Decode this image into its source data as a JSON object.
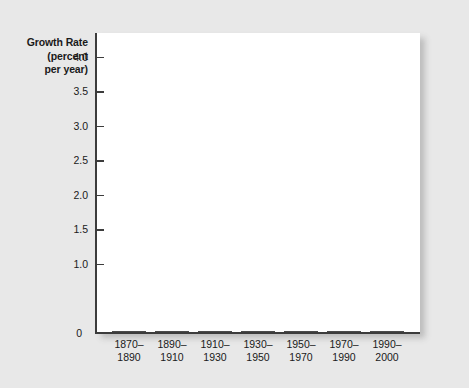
{
  "chart_data": {
    "type": "bar",
    "title": "",
    "subtitle": "",
    "xlabel": "",
    "ylabel": "Growth Rate (percent per year)",
    "ylabel_lines": [
      "Growth Rate",
      "(percent",
      "per year)"
    ],
    "categories": [
      "1870–1890",
      "1890–1910",
      "1910–1930",
      "1930–1950",
      "1950–1970",
      "1970–1990",
      "1990–2000"
    ],
    "category_lines": [
      [
        "1870–",
        "1890"
      ],
      [
        "1890–",
        "1910"
      ],
      [
        "1910–",
        "1930"
      ],
      [
        "1930–",
        "1950"
      ],
      [
        "1950–",
        "1970"
      ],
      [
        "1970–",
        "1990"
      ],
      [
        "1990–",
        "2000"
      ]
    ],
    "values": [
      1.18,
      1.5,
      1.31,
      1.41,
      3.87,
      2.19,
      1.73
    ],
    "ylim": [
      0,
      4.35
    ],
    "yticks": [
      0,
      1.0,
      1.5,
      2.0,
      2.5,
      3.0,
      3.5,
      4.0
    ],
    "ytick_labels": [
      "0",
      "1.0",
      "1.5",
      "2.0",
      "2.5",
      "3.0",
      "3.5",
      "4.0"
    ],
    "grid": false,
    "legend": null,
    "legend_position": "none",
    "bar_color": "#8e8e8e",
    "bar_edge_color": "#4a4a4a",
    "plot_background": "#ffffff",
    "page_background": "#e8e8e8",
    "axis_color": "#3c3c3c",
    "text_color": "#1a1a1a"
  }
}
